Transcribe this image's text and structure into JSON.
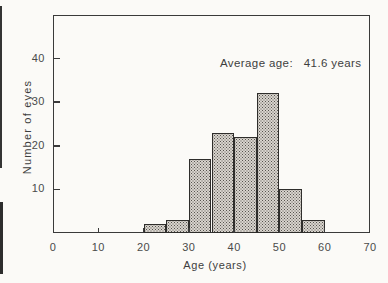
{
  "figure": {
    "background": "#fbfaf7",
    "ink": "#3a3a3a",
    "bar_base_color": "#d8d4ce",
    "bar_dot_color": "#56534e"
  },
  "chart_data": {
    "type": "bar",
    "chart_kind": "histogram",
    "title": "",
    "xlabel": "Age (years)",
    "ylabel": "Number of eyes",
    "annotation": "Average age:   41.6 years",
    "average_age_years": 41.6,
    "categories": [
      "20-25",
      "25-30",
      "30-35",
      "35-40",
      "40-45",
      "45-50",
      "50-55",
      "55-60"
    ],
    "bin_edges": [
      20,
      25,
      30,
      35,
      40,
      45,
      50,
      55,
      60
    ],
    "values": [
      2,
      3,
      17,
      23,
      22,
      32,
      10,
      3
    ],
    "xlim": [
      0,
      70
    ],
    "ylim": [
      0,
      50
    ],
    "xticks": [
      0,
      10,
      20,
      30,
      40,
      50,
      60,
      70
    ],
    "yticks": [
      10,
      20,
      30,
      40
    ],
    "grid": false,
    "legend": false,
    "bar_fill": "halftone-dot-screen"
  }
}
